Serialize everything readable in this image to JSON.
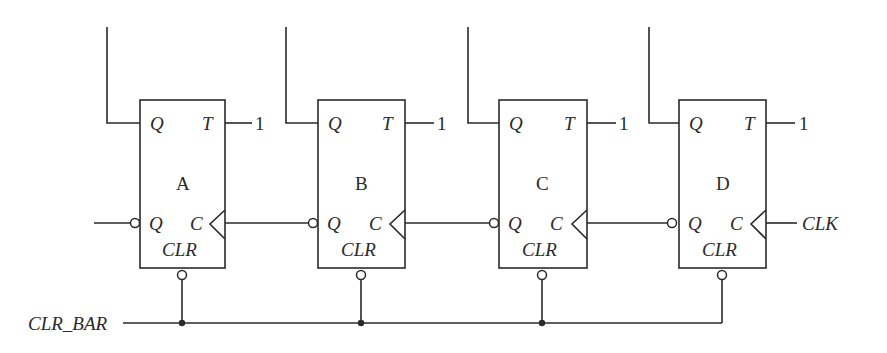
{
  "diagram": {
    "title": "",
    "flip_flops": [
      {
        "name": "A",
        "q_label": "Q",
        "qbar_label": "Q",
        "t_label": "T",
        "t_input": "1",
        "clk_label": "C",
        "clr_label": "CLR"
      },
      {
        "name": "B",
        "q_label": "Q",
        "qbar_label": "Q",
        "t_label": "T",
        "t_input": "1",
        "clk_label": "C",
        "clr_label": "CLR"
      },
      {
        "name": "C",
        "q_label": "Q",
        "qbar_label": "Q",
        "t_label": "T",
        "t_input": "1",
        "clk_label": "C",
        "clr_label": "CLR"
      },
      {
        "name": "D",
        "q_label": "Q",
        "qbar_label": "Q",
        "t_label": "T",
        "t_input": "1",
        "clk_label": "C",
        "clr_label": "CLR"
      }
    ],
    "signals": {
      "clear": "CLR_BAR",
      "clock": "CLK"
    }
  }
}
